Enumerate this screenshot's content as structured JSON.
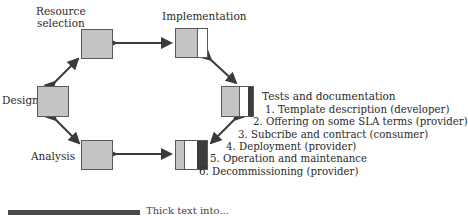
{
  "diagram": {
    "nodes": {
      "resource_selection": {
        "label_line1": "Resource",
        "label_line2": "selection"
      },
      "implementation": {
        "label": "Implementation"
      },
      "design": {
        "label": "Design"
      },
      "tests": {
        "label": "Tests and documentation"
      },
      "analysis": {
        "label": "Analysis"
      }
    },
    "steps": [
      "1. Template description (developer)",
      "2. Offering on some SLA terms (provider)",
      "3. Subcribe and contract (consumer)",
      "4. Deployment (provider)",
      "5. Operation and maintenance",
      "6. Decommissioning (provider)"
    ],
    "legend": {
      "text": "Thick text into..."
    },
    "colors": {
      "gray": "#c4c4c4",
      "dark": "#3c3c3c",
      "arrow": "#3a3a3a"
    }
  }
}
